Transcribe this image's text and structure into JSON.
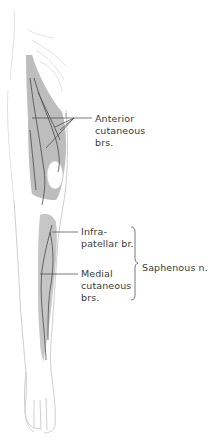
{
  "figure": {
    "colors": {
      "background": "#ffffff",
      "limb_outline": "#d0d0d0",
      "shaded_region": "#b9b9b9",
      "nerve_line": "#4a4a4a",
      "leader_line": "#444444",
      "label_text": "#3a3a3a"
    }
  },
  "labels": {
    "anterior_cutaneous": "Anterior\ncutaneous\nbrs.",
    "infrapatellar": "Infra-\npatellar br.",
    "medial_cutaneous": "Medial\ncutaneous\nbrs.",
    "saphenous": "Saphenous n."
  },
  "icons": {
    "bracket": "right-curly-brace"
  }
}
